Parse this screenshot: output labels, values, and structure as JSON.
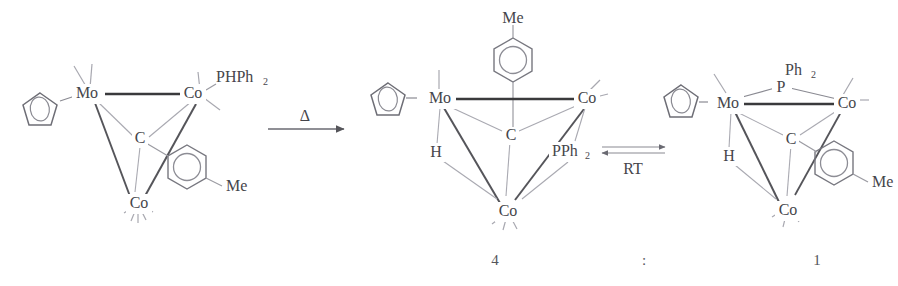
{
  "scheme": {
    "title": "Thermal isomerization of a MoCo2 cluster with PHPh2 ligand",
    "colors": {
      "ink": "#45454a",
      "bond_strong": "#3a3a3c",
      "bond_faint": "#9b9ba2",
      "background": "#ffffff"
    },
    "structures": [
      {
        "id": "reactant",
        "name": "MoCo2 cluster with terminal PHPh2",
        "labels": {
          "mo": "Mo",
          "co_right": "Co",
          "co_bottom": "Co",
          "carbyne": "C",
          "phosphine": "PHPh",
          "phosphine_sub": "2",
          "methyl": "Me"
        },
        "ligands": {
          "cp": "cyclopentadienyl",
          "aryl": "tolyl"
        }
      },
      {
        "id": "product-major",
        "name": "Hydrido phosphido MoCo2 cluster, Co-Co bridged PPh2",
        "caption": "4",
        "labels": {
          "mo": "Mo",
          "co_right": "Co",
          "co_bottom": "Co",
          "carbyne": "C",
          "hydride": "H",
          "phosphido": "PPh",
          "phosphido_sub": "2",
          "methyl": "Me"
        },
        "ligands": {
          "cp": "cyclopentadienyl",
          "aryl": "tolyl"
        }
      },
      {
        "id": "product-minor",
        "name": "Hydrido phosphido MoCo2 cluster, Mo-Co bridged PPh2",
        "caption": "1",
        "labels": {
          "mo": "Mo",
          "co_right": "Co",
          "co_bottom": "Co",
          "carbyne": "C",
          "hydride": "H",
          "phosphido_p": "P",
          "phosphido_ph": "Ph",
          "phosphido_sub": "2",
          "methyl": "Me"
        },
        "ligands": {
          "cp": "cyclopentadienyl",
          "aryl": "tolyl"
        }
      }
    ],
    "arrows": [
      {
        "id": "thermal",
        "type": "forward",
        "label": "Δ"
      },
      {
        "id": "equilibrium",
        "type": "equilibrium",
        "label": "RT"
      }
    ],
    "ratio": {
      "left": "4",
      "separator": ":",
      "right": "1"
    }
  }
}
